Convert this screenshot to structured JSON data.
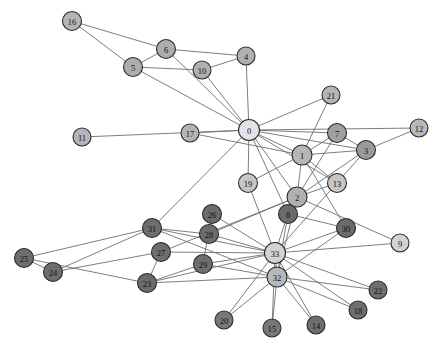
{
  "figure": {
    "title": "",
    "background_color": "#ffffff",
    "width": 444,
    "height": 351
  },
  "style": {
    "edge_color": "#6e6e6e",
    "edge_width": 0.9,
    "node_stroke_color": "#2b2b2b",
    "node_stroke_width": 1.1,
    "label_color": "#111111",
    "label_font_size": 8.5
  },
  "chart_data": {
    "type": "scatter",
    "title": "",
    "xlabel": "",
    "ylabel": "",
    "subtitle": "",
    "graph_kind": "node-link-network",
    "layout": "spring",
    "directed": false,
    "grid": false,
    "legend": "none",
    "node_count": 34,
    "edge_count": 78,
    "xlim": [
      0,
      444
    ],
    "ylim": [
      0,
      351
    ],
    "nodes": [
      {
        "id": "0",
        "label": "0",
        "x": 249,
        "y": 130,
        "r": 10.5,
        "color": "#e3e3e3"
      },
      {
        "id": "1",
        "label": "1",
        "x": 302,
        "y": 155,
        "r": 10.0,
        "color": "#b5b5b5"
      },
      {
        "id": "2",
        "label": "2",
        "x": 297,
        "y": 197,
        "r": 10.0,
        "color": "#b0b0b0"
      },
      {
        "id": "3",
        "label": "3",
        "x": 366,
        "y": 150,
        "r": 9.5,
        "color": "#9a9a9a"
      },
      {
        "id": "4",
        "label": "4",
        "x": 246,
        "y": 56,
        "r": 9.0,
        "color": "#b0b0b0"
      },
      {
        "id": "5",
        "label": "5",
        "x": 133,
        "y": 67,
        "r": 9.5,
        "color": "#adadad"
      },
      {
        "id": "6",
        "label": "6",
        "x": 166,
        "y": 49,
        "r": 9.5,
        "color": "#adadad"
      },
      {
        "id": "7",
        "label": "7",
        "x": 337,
        "y": 133,
        "r": 9.5,
        "color": "#a0a0a0"
      },
      {
        "id": "8",
        "label": "8",
        "x": 288,
        "y": 214,
        "r": 9.5,
        "color": "#6b6b6b"
      },
      {
        "id": "9",
        "label": "9",
        "x": 400,
        "y": 243,
        "r": 9.0,
        "color": "#d2d2d2"
      },
      {
        "id": "10",
        "label": "10",
        "x": 202,
        "y": 70,
        "r": 9.0,
        "color": "#b0b0b0"
      },
      {
        "id": "11",
        "label": "11",
        "x": 82,
        "y": 137,
        "r": 9.0,
        "color": "#b5b5b5"
      },
      {
        "id": "12",
        "label": "12",
        "x": 419,
        "y": 128,
        "r": 9.0,
        "color": "#b8b8b8"
      },
      {
        "id": "13",
        "label": "13",
        "x": 337,
        "y": 183,
        "r": 9.5,
        "color": "#c6c6c6"
      },
      {
        "id": "14",
        "label": "14",
        "x": 316,
        "y": 325,
        "r": 9.0,
        "color": "#6e6e6e"
      },
      {
        "id": "15",
        "label": "15",
        "x": 272,
        "y": 328,
        "r": 9.0,
        "color": "#787878"
      },
      {
        "id": "16",
        "label": "16",
        "x": 72,
        "y": 21,
        "r": 9.5,
        "color": "#b5b5b5"
      },
      {
        "id": "17",
        "label": "17",
        "x": 190,
        "y": 133,
        "r": 9.0,
        "color": "#b5b5b5"
      },
      {
        "id": "18",
        "label": "18",
        "x": 358,
        "y": 310,
        "r": 9.0,
        "color": "#6e6e6e"
      },
      {
        "id": "19",
        "label": "19",
        "x": 248,
        "y": 183,
        "r": 9.5,
        "color": "#c6c6c6"
      },
      {
        "id": "20",
        "label": "20",
        "x": 224,
        "y": 320,
        "r": 9.0,
        "color": "#787878"
      },
      {
        "id": "21",
        "label": "21",
        "x": 331,
        "y": 95,
        "r": 9.0,
        "color": "#b5b5b5"
      },
      {
        "id": "22",
        "label": "22",
        "x": 378,
        "y": 290,
        "r": 9.0,
        "color": "#6e6e6e"
      },
      {
        "id": "23",
        "label": "23",
        "x": 147,
        "y": 283,
        "r": 9.5,
        "color": "#6b6b6b"
      },
      {
        "id": "24",
        "label": "24",
        "x": 53,
        "y": 272,
        "r": 9.5,
        "color": "#6e6e6e"
      },
      {
        "id": "25",
        "label": "25",
        "x": 24,
        "y": 258,
        "r": 9.5,
        "color": "#6e6e6e"
      },
      {
        "id": "26",
        "label": "26",
        "x": 212,
        "y": 214,
        "r": 9.5,
        "color": "#6b6b6b"
      },
      {
        "id": "27",
        "label": "27",
        "x": 161,
        "y": 252,
        "r": 9.5,
        "color": "#6e6e6e"
      },
      {
        "id": "28",
        "label": "28",
        "x": 209,
        "y": 234,
        "r": 9.5,
        "color": "#6b6b6b"
      },
      {
        "id": "29",
        "label": "29",
        "x": 203,
        "y": 264,
        "r": 9.5,
        "color": "#6e6e6e"
      },
      {
        "id": "30",
        "label": "30",
        "x": 346,
        "y": 228,
        "r": 9.5,
        "color": "#6b6b6b"
      },
      {
        "id": "31",
        "label": "31",
        "x": 152,
        "y": 228,
        "r": 9.5,
        "color": "#6e6e6e"
      },
      {
        "id": "32",
        "label": "32",
        "x": 277,
        "y": 277,
        "r": 10.0,
        "color": "#b8b8b8"
      },
      {
        "id": "33",
        "label": "33",
        "x": 275,
        "y": 253,
        "r": 10.5,
        "color": "#d2d2d2"
      }
    ],
    "edges": [
      [
        "0",
        "1"
      ],
      [
        "0",
        "2"
      ],
      [
        "0",
        "3"
      ],
      [
        "0",
        "4"
      ],
      [
        "0",
        "5"
      ],
      [
        "0",
        "6"
      ],
      [
        "0",
        "7"
      ],
      [
        "0",
        "8"
      ],
      [
        "0",
        "10"
      ],
      [
        "0",
        "11"
      ],
      [
        "0",
        "12"
      ],
      [
        "0",
        "13"
      ],
      [
        "0",
        "17"
      ],
      [
        "0",
        "19"
      ],
      [
        "0",
        "21"
      ],
      [
        "0",
        "31"
      ],
      [
        "1",
        "2"
      ],
      [
        "1",
        "3"
      ],
      [
        "1",
        "7"
      ],
      [
        "1",
        "13"
      ],
      [
        "1",
        "17"
      ],
      [
        "1",
        "19"
      ],
      [
        "1",
        "21"
      ],
      [
        "1",
        "30"
      ],
      [
        "2",
        "3"
      ],
      [
        "2",
        "7"
      ],
      [
        "2",
        "8"
      ],
      [
        "2",
        "9"
      ],
      [
        "2",
        "13"
      ],
      [
        "2",
        "27"
      ],
      [
        "2",
        "28"
      ],
      [
        "2",
        "32"
      ],
      [
        "3",
        "7"
      ],
      [
        "3",
        "12"
      ],
      [
        "3",
        "13"
      ],
      [
        "4",
        "6"
      ],
      [
        "4",
        "10"
      ],
      [
        "5",
        "6"
      ],
      [
        "5",
        "10"
      ],
      [
        "5",
        "16"
      ],
      [
        "6",
        "16"
      ],
      [
        "8",
        "30"
      ],
      [
        "8",
        "32"
      ],
      [
        "8",
        "33"
      ],
      [
        "9",
        "33"
      ],
      [
        "13",
        "33"
      ],
      [
        "14",
        "32"
      ],
      [
        "14",
        "33"
      ],
      [
        "15",
        "32"
      ],
      [
        "15",
        "33"
      ],
      [
        "18",
        "32"
      ],
      [
        "18",
        "33"
      ],
      [
        "19",
        "33"
      ],
      [
        "20",
        "32"
      ],
      [
        "20",
        "33"
      ],
      [
        "22",
        "32"
      ],
      [
        "22",
        "33"
      ],
      [
        "23",
        "25"
      ],
      [
        "23",
        "27"
      ],
      [
        "23",
        "29"
      ],
      [
        "23",
        "32"
      ],
      [
        "23",
        "33"
      ],
      [
        "24",
        "25"
      ],
      [
        "24",
        "27"
      ],
      [
        "24",
        "31"
      ],
      [
        "25",
        "31"
      ],
      [
        "26",
        "29"
      ],
      [
        "26",
        "33"
      ],
      [
        "27",
        "33"
      ],
      [
        "28",
        "31"
      ],
      [
        "28",
        "33"
      ],
      [
        "29",
        "32"
      ],
      [
        "29",
        "33"
      ],
      [
        "30",
        "32"
      ],
      [
        "30",
        "33"
      ],
      [
        "31",
        "32"
      ],
      [
        "31",
        "33"
      ],
      [
        "32",
        "33"
      ]
    ]
  }
}
